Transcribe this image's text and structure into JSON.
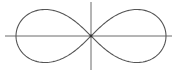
{
  "diagram": {
    "title": "",
    "type": "lemniscate-of-bernoulli",
    "background": "#ffffff",
    "axes": {
      "color": "#6a6a6a",
      "stroke_width": 1,
      "x_axis": {
        "x1": 5,
        "x2": 172,
        "y": 36
      },
      "y_axis": {
        "x": 91,
        "y1": 2,
        "y2": 70
      }
    },
    "curve": {
      "color": "#555555",
      "stroke_width": 1.1,
      "center_x": 91,
      "center_y": 36,
      "half_width_a": 75,
      "samples": 240,
      "equation": "(x^2 + y^2)^2 = a^2 (x^2 - y^2)"
    },
    "origin_marker": {
      "x": 91,
      "y": 36,
      "r": 1.4,
      "color": "#333333"
    }
  }
}
